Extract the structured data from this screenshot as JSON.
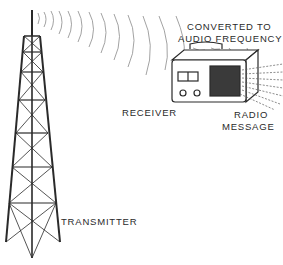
{
  "diagram": {
    "type": "illustration",
    "labels": {
      "converted_line1": "CONVERTED TO",
      "converted_line2": "AUDIO FREQUENCY",
      "receiver": "RECEIVER",
      "radio_line1": "RADIO",
      "radio_line2": "MESSAGE",
      "transmitter": "TRANSMITTER"
    },
    "elements": [
      "transmitter-tower",
      "radio-waves",
      "receiver-radio",
      "sound-waves"
    ],
    "colors": {
      "ink": "#2a2a2a",
      "waves": "#8a8a8a",
      "background": "#ffffff"
    }
  }
}
